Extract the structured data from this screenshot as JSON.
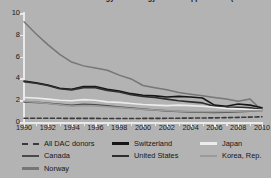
{
  "chart_data": {
    "type": "line",
    "title": "Patents in Renewable Energy Technology Related Applications (% of total)",
    "xlabel": "",
    "ylabel": "",
    "xlim": [
      1990,
      2010
    ],
    "ylim": [
      0,
      10
    ],
    "grid": false,
    "legend_position": "bottom",
    "x_ticks": [
      1990,
      1992,
      1994,
      1996,
      1998,
      2000,
      2002,
      2004,
      2006,
      2008,
      2010
    ],
    "y_ticks": [
      0,
      2,
      4,
      6,
      8,
      10
    ],
    "x": [
      1990,
      1991,
      1992,
      1993,
      1994,
      1995,
      1996,
      1997,
      1998,
      1999,
      2000,
      2001,
      2002,
      2003,
      2004,
      2005,
      2006,
      2007,
      2008,
      2009,
      2010
    ],
    "series": [
      {
        "name": "All DAC donors",
        "color": "#3a3a3a",
        "style": "dashed",
        "values": [
          0.35,
          0.35,
          0.34,
          0.34,
          0.33,
          0.33,
          0.33,
          0.32,
          0.32,
          0.32,
          0.33,
          0.33,
          0.34,
          0.35,
          0.36,
          0.37,
          0.38,
          0.4,
          0.42,
          0.45,
          0.48
        ]
      },
      {
        "name": "Canada",
        "color": "#4a4a4a",
        "style": "solid",
        "values": [
          1.85,
          1.8,
          1.72,
          1.62,
          1.54,
          1.62,
          1.58,
          1.48,
          1.38,
          1.28,
          1.18,
          1.1,
          1.02,
          0.96,
          0.92,
          0.9,
          0.88,
          0.9,
          0.95,
          1.0,
          1.05
        ]
      },
      {
        "name": "Norway",
        "color": "#767676",
        "style": "solid",
        "values": [
          9.2,
          8.1,
          7.1,
          6.2,
          5.5,
          5.15,
          4.95,
          4.75,
          4.3,
          3.95,
          3.35,
          3.15,
          2.95,
          2.7,
          2.55,
          2.4,
          2.25,
          2.1,
          1.9,
          2.1,
          1.05
        ]
      },
      {
        "name": "Switzerland",
        "color": "#161616",
        "style": "solid",
        "values": [
          3.75,
          3.6,
          3.4,
          3.1,
          3.0,
          3.25,
          3.25,
          3.0,
          2.85,
          2.6,
          2.45,
          2.4,
          2.3,
          2.35,
          2.3,
          2.2,
          1.55,
          1.45,
          1.65,
          1.55,
          1.3
        ]
      },
      {
        "name": "United States",
        "color": "#2e2e2e",
        "style": "solid",
        "values": [
          3.7,
          3.55,
          3.35,
          3.05,
          2.95,
          3.15,
          3.15,
          2.9,
          2.75,
          2.5,
          2.35,
          2.25,
          2.1,
          1.95,
          1.85,
          1.75,
          1.45,
          1.35,
          1.35,
          1.3,
          1.15
        ]
      },
      {
        "name": "Japan",
        "color": "#ececec",
        "style": "solid",
        "values": [
          2.25,
          2.2,
          2.1,
          2.0,
          1.95,
          2.05,
          2.0,
          1.85,
          1.8,
          1.7,
          1.6,
          1.55,
          1.5,
          1.55,
          1.5,
          1.45,
          1.35,
          1.25,
          1.2,
          1.15,
          1.1
        ]
      },
      {
        "name": "Korea, Rep.",
        "color": "#9a9a9a",
        "style": "solid",
        "values": [
          1.9,
          1.82,
          1.7,
          1.58,
          1.46,
          1.52,
          1.48,
          1.4,
          1.32,
          1.24,
          1.16,
          1.1,
          1.04,
          1.0,
          0.96,
          0.94,
          0.94,
          0.96,
          1.0,
          1.02,
          1.04
        ]
      }
    ]
  },
  "legend": {
    "columns": [
      [
        {
          "label": "All DAC donors",
          "color": "#3a3a3a",
          "style": "dashed"
        },
        {
          "label": "Canada",
          "color": "#4a4a4a",
          "style": "solid"
        },
        {
          "label": "Norway",
          "color": "#767676",
          "style": "solid"
        }
      ],
      [
        {
          "label": "Switzerland",
          "color": "#161616",
          "style": "solid"
        },
        {
          "label": "United States",
          "color": "#2e2e2e",
          "style": "solid"
        }
      ],
      [
        {
          "label": "Japan",
          "color": "#ececec",
          "style": "solid"
        },
        {
          "label": "Korea, Rep.",
          "color": "#9a9a9a",
          "style": "solid"
        }
      ]
    ]
  },
  "colors": {
    "background": "#b3b3b3",
    "axis": "#e9e9e9",
    "text": "#1a1a1a"
  }
}
